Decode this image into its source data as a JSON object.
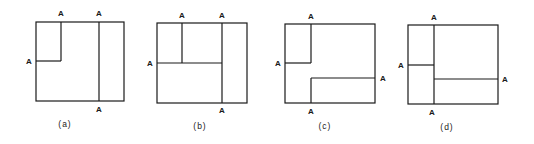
{
  "colors": {
    "line": "#1a1a1a",
    "background": "#ffffff"
  },
  "panels": [
    {
      "caption": "(a)",
      "box": {
        "x1": 36,
        "y1": 22,
        "x2": 124,
        "y2": 101
      },
      "segments": [
        {
          "x1": 61,
          "y1": 22,
          "x2": 61,
          "y2": 61
        },
        {
          "x1": 36,
          "y1": 61,
          "x2": 61,
          "y2": 61
        },
        {
          "x1": 99,
          "y1": 22,
          "x2": 99,
          "y2": 101
        }
      ],
      "labels": [
        {
          "text": "A",
          "x": 61,
          "y": 16
        },
        {
          "text": "A",
          "x": 99,
          "y": 16
        },
        {
          "text": "A",
          "x": 29,
          "y": 64
        },
        {
          "text": "A",
          "x": 99,
          "y": 112
        }
      ],
      "caption_pos": {
        "x": 65,
        "y": 127
      }
    },
    {
      "caption": "(b)",
      "box": {
        "x1": 157,
        "y1": 23,
        "x2": 247,
        "y2": 103
      },
      "segments": [
        {
          "x1": 182,
          "y1": 23,
          "x2": 182,
          "y2": 63
        },
        {
          "x1": 157,
          "y1": 63,
          "x2": 222,
          "y2": 63
        },
        {
          "x1": 222,
          "y1": 23,
          "x2": 222,
          "y2": 103
        }
      ],
      "labels": [
        {
          "text": "A",
          "x": 182,
          "y": 18
        },
        {
          "text": "A",
          "x": 222,
          "y": 18
        },
        {
          "text": "A",
          "x": 150,
          "y": 66
        },
        {
          "text": "A",
          "x": 222,
          "y": 113
        }
      ],
      "caption_pos": {
        "x": 200,
        "y": 129
      }
    },
    {
      "caption": "(c)",
      "box": {
        "x1": 285,
        "y1": 24,
        "x2": 375,
        "y2": 103
      },
      "segments": [
        {
          "x1": 311,
          "y1": 24,
          "x2": 311,
          "y2": 63
        },
        {
          "x1": 285,
          "y1": 63,
          "x2": 311,
          "y2": 63
        },
        {
          "x1": 311,
          "y1": 78,
          "x2": 311,
          "y2": 103
        },
        {
          "x1": 311,
          "y1": 78,
          "x2": 375,
          "y2": 78
        }
      ],
      "labels": [
        {
          "text": "A",
          "x": 311,
          "y": 19
        },
        {
          "text": "A",
          "x": 278,
          "y": 66
        },
        {
          "text": "A",
          "x": 383,
          "y": 81
        },
        {
          "text": "A",
          "x": 311,
          "y": 114
        }
      ],
      "caption_pos": {
        "x": 325,
        "y": 129
      }
    },
    {
      "caption": "(d)",
      "box": {
        "x1": 408,
        "y1": 25,
        "x2": 498,
        "y2": 104
      },
      "segments": [
        {
          "x1": 434,
          "y1": 25,
          "x2": 434,
          "y2": 104
        },
        {
          "x1": 408,
          "y1": 65,
          "x2": 434,
          "y2": 65
        },
        {
          "x1": 434,
          "y1": 79,
          "x2": 498,
          "y2": 79
        }
      ],
      "labels": [
        {
          "text": "A",
          "x": 434,
          "y": 20
        },
        {
          "text": "A",
          "x": 401,
          "y": 68
        },
        {
          "text": "A",
          "x": 505,
          "y": 82
        },
        {
          "text": "A",
          "x": 432,
          "y": 115
        }
      ],
      "caption_pos": {
        "x": 447,
        "y": 130
      }
    }
  ]
}
